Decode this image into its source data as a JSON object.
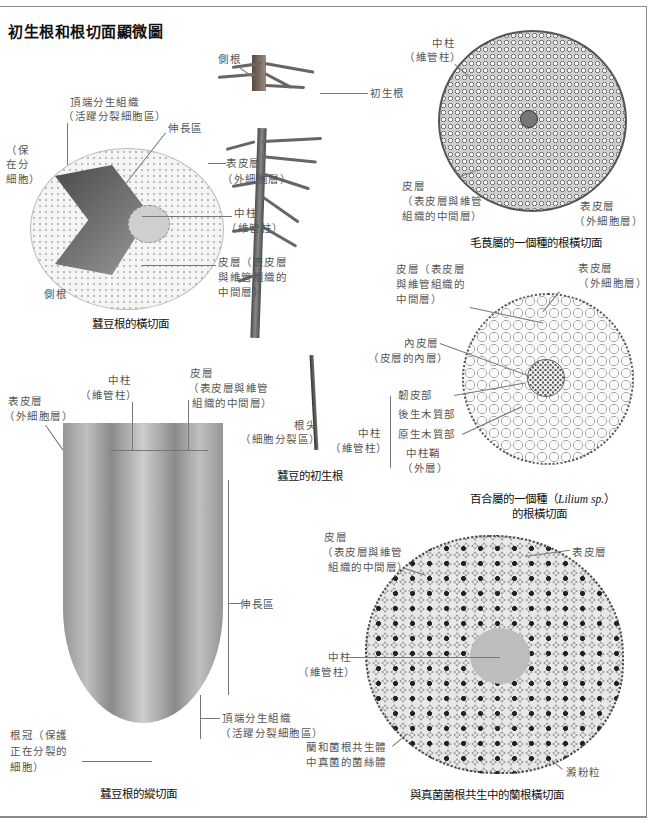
{
  "title": "初生根和根切面顯微圖",
  "page_number": "",
  "seedling": {
    "labels": {
      "lateral_root": "側根",
      "primary_root": "初生根",
      "root_tip": "根尖",
      "root_tip_note": "（細胞分裂區）"
    },
    "caption": "蠶豆的初生根"
  },
  "broad_bean_cross": {
    "labels": {
      "apical_meristem": "頂端分生組織",
      "apical_meristem_note": "（活躍分裂細胞區）",
      "elongation_zone": "伸長區",
      "root_cap_partial_1": "（保",
      "root_cap_partial_2": "在分",
      "root_cap_partial_3": "細胞）",
      "epidermis": "表皮層",
      "epidermis_note": "（外細胞層）",
      "stele": "中柱",
      "stele_note": "（維管柱）",
      "cortex_1": "皮層（表皮層",
      "cortex_2": "與維管組織的",
      "cortex_3": "中間層）",
      "lateral_root": "側根"
    },
    "caption": "蠶豆根的橫切面"
  },
  "horsetail": {
    "labels": {
      "stele": "中柱",
      "stele_note": "（維管柱）",
      "cortex": "皮層",
      "cortex_note_1": "（表皮層與維管",
      "cortex_note_2": "組織的中間層）",
      "epidermis": "表皮層",
      "epidermis_note": "（外細胞層）"
    },
    "caption": "毛茛屬的一個種的根橫切面"
  },
  "lily": {
    "labels": {
      "cortex_1": "皮層（表皮層",
      "cortex_2": "與維管組織的",
      "cortex_3": "中間層）",
      "epidermis": "表皮層",
      "epidermis_note": "（外細胞層）",
      "endodermis": "內皮層",
      "endodermis_note": "（皮層的內層）",
      "phloem": "韌皮部",
      "metaxylem": "後生木質部",
      "protoxylem": "原生木質部",
      "pericycle": "中柱鞘",
      "pericycle_note": "（外層）",
      "stele": "中柱",
      "stele_note": "（維管柱）"
    },
    "caption_1": "百合屬的一個種（",
    "caption_species": "Lilium sp.",
    "caption_2": "）",
    "caption_3": "的根橫切面"
  },
  "broad_bean_long": {
    "labels": {
      "stele": "中柱",
      "stele_note": "（維管柱）",
      "cortex": "皮層",
      "cortex_note_1": "（表皮層與維管",
      "cortex_note_2": "組織的中間層）",
      "epidermis": "表皮層",
      "epidermis_note": "（外細胞層）",
      "elongation_zone": "伸長區",
      "apical_meristem": "頂端分生組織",
      "apical_meristem_note": "（活躍分裂細胞區）",
      "root_cap_1": "根冠（保護",
      "root_cap_2": "正在分裂的",
      "root_cap_3": "細胞）"
    },
    "caption": "蠶豆根的縱切面"
  },
  "orchid": {
    "labels": {
      "cortex": "皮層",
      "cortex_note_1": "（表皮層與維管",
      "cortex_note_2": "組織的中間層）",
      "epidermis": "表皮層",
      "stele": "中柱",
      "stele_note": "（維管柱）",
      "hyphae_1": "蘭和菌根共生體",
      "hyphae_2": "中真菌的菌絲體",
      "starch": "澱粉粒"
    },
    "caption": "與真菌菌根共生中的蘭根橫切面"
  }
}
